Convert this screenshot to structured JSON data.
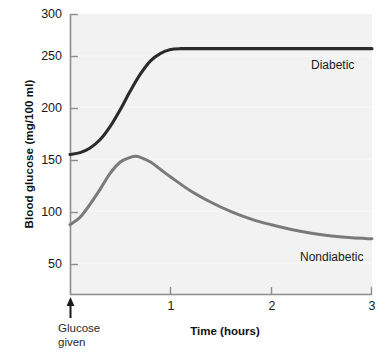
{
  "chart_data": {
    "type": "line",
    "title": "",
    "xlabel": "Time (hours)",
    "ylabel": "Blood glucose (mg/100 ml)",
    "xlim": [
      0,
      3
    ],
    "ylim": [
      0,
      300
    ],
    "xticks": [
      1,
      2,
      3
    ],
    "xtick_labels": [
      "1",
      "2",
      "3"
    ],
    "yticks": [
      50,
      100,
      150,
      200,
      250,
      300
    ],
    "ytick_labels": [
      "50",
      "100",
      "150",
      "200",
      "250",
      "300"
    ],
    "grid": false,
    "legend_position": "inline-right",
    "annotations": [
      {
        "name": "glucose-given",
        "text_line1": "Glucose",
        "text_line2": "given",
        "x": 0,
        "marker": "up-arrow"
      }
    ],
    "series": [
      {
        "name": "Diabetic",
        "color": "#2b2b2b",
        "x": [
          0.0,
          0.1,
          0.2,
          0.3,
          0.4,
          0.5,
          0.6,
          0.7,
          0.8,
          0.9,
          1.0,
          1.1,
          1.2,
          1.4,
          1.6,
          1.8,
          2.0,
          2.2,
          2.4,
          2.6,
          2.8,
          3.0
        ],
        "values": [
          150,
          152,
          157,
          166,
          180,
          198,
          218,
          236,
          250,
          258,
          262,
          263,
          263,
          263,
          263,
          263,
          263,
          263,
          263,
          263,
          263,
          263
        ]
      },
      {
        "name": "Nondiabetic",
        "color": "#7a7a7a",
        "x": [
          0.0,
          0.1,
          0.2,
          0.3,
          0.4,
          0.5,
          0.6,
          0.65,
          0.7,
          0.8,
          0.9,
          1.0,
          1.2,
          1.4,
          1.6,
          1.8,
          2.0,
          2.2,
          2.4,
          2.6,
          2.8,
          3.0
        ],
        "values": [
          75,
          83,
          97,
          113,
          130,
          142,
          147,
          148,
          147,
          142,
          134,
          126,
          111,
          99,
          89,
          81,
          75,
          70,
          66,
          63,
          61,
          60
        ]
      }
    ]
  },
  "axis_labels": {
    "y_title": "Blood glucose (mg/100 ml)",
    "x_title": "Time (hours)",
    "y_300": "300",
    "y_250": "250",
    "y_200": "200",
    "y_150": "150",
    "y_100": "100",
    "y_50": "50",
    "x_1": "1",
    "x_2": "2",
    "x_3": "3"
  },
  "annotation": {
    "line1": "Glucose",
    "line2": "given"
  },
  "series_labels": {
    "diabetic": "Diabetic",
    "nondiabetic": "Nondiabetic"
  },
  "colors": {
    "diabetic_line": "#2b2b2b",
    "nondiabetic_line": "#7a7a7a",
    "axis": "#8d8d8d",
    "plot_background": "#f2f2f2",
    "page_background": "#ffffff",
    "text": "#1a1a1a"
  }
}
